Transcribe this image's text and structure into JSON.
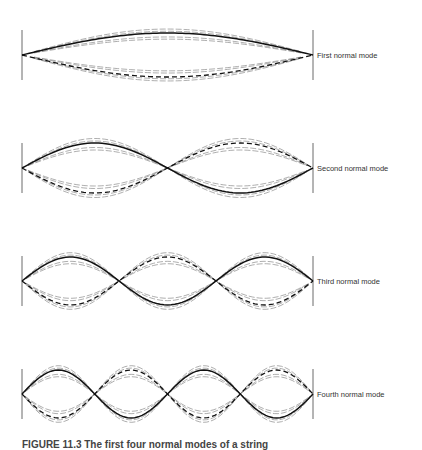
{
  "figure": {
    "modes": [
      {
        "label": "First normal mode",
        "n": 1,
        "center_y": 55,
        "amplitude": 22
      },
      {
        "label": "Second normal mode",
        "n": 2,
        "center_y": 168,
        "amplitude": 25
      },
      {
        "label": "Third normal mode",
        "n": 3,
        "center_y": 281,
        "amplitude": 24
      },
      {
        "label": "Fourth normal mode",
        "n": 4,
        "center_y": 394,
        "amplitude": 24
      }
    ],
    "string": {
      "x_left": 22,
      "x_right": 313,
      "wall_half_height": 25
    },
    "caption": "FIGURE 11.3 The first four normal modes of a string"
  }
}
